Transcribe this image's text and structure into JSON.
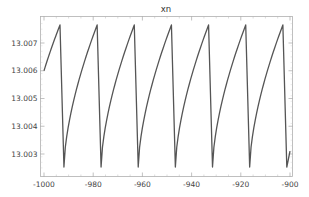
{
  "chart_data": {
    "type": "line",
    "title": "xn",
    "xlabel": "",
    "ylabel": "",
    "xlim": [
      -1001.5,
      -899
    ],
    "ylim": [
      13.00243,
      13.0078
    ],
    "grid": false,
    "legend": null,
    "x_ticks": [
      -1000,
      -980,
      -960,
      -940,
      -920,
      -900
    ],
    "x_tick_labels": [
      "-1000",
      "-980",
      "-960",
      "-940",
      "-920",
      "-900"
    ],
    "y_ticks": [
      13.003,
      13.004,
      13.005,
      13.006,
      13.007
    ],
    "y_tick_labels": [
      "13.003",
      "13.004",
      "13.005",
      "13.006",
      "13.007"
    ],
    "line_color": "#555555",
    "series": [
      {
        "name": "xn",
        "period": 15.1,
        "peak_value": 13.00765,
        "trough_value": 13.00253,
        "start": {
          "x": -1000,
          "y": 13.006
        },
        "peaks_x": [
          -993.5,
          -978.4,
          -963.3,
          -948.2,
          -933.1,
          -918.0,
          -902.9
        ],
        "troughs_x": [
          -991.9,
          -976.8,
          -961.7,
          -946.6,
          -931.5,
          -916.4,
          -901.3
        ],
        "end": {
          "x": -900,
          "y": 13.0031
        }
      }
    ]
  }
}
